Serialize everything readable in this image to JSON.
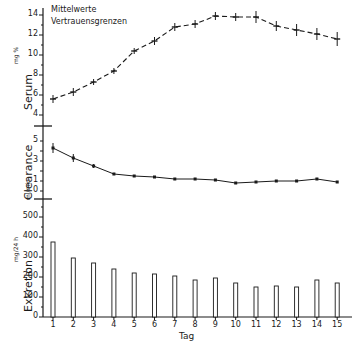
{
  "chart_data": [
    {
      "type": "line",
      "panel": "serum",
      "ylabel": "Serum",
      "yunit": "mg %",
      "yticks": [
        4,
        6,
        8,
        10,
        12,
        14
      ],
      "ylim": [
        3.5,
        14.5
      ],
      "x": [
        1,
        2,
        3,
        4,
        5,
        6,
        7,
        8,
        9,
        10,
        11,
        12,
        13,
        14,
        15
      ],
      "values": [
        5.6,
        6.3,
        7.3,
        8.4,
        10.4,
        11.4,
        12.8,
        13.1,
        13.9,
        13.8,
        13.8,
        12.9,
        12.5,
        12.1,
        11.6
      ],
      "error": [
        0.4,
        0.4,
        0.3,
        0.3,
        0.3,
        0.4,
        0.4,
        0.4,
        0.4,
        0.4,
        0.6,
        0.5,
        0.6,
        0.6,
        0.7
      ],
      "line_style": "dashed"
    },
    {
      "type": "line",
      "panel": "clearance",
      "ylabel": "Clearance",
      "yunit": "ml/min",
      "yticks": [
        0,
        1,
        3,
        5
      ],
      "ylim": [
        -0.5,
        5.5
      ],
      "x": [
        1,
        2,
        3,
        4,
        5,
        6,
        7,
        8,
        9,
        10,
        11,
        12,
        13,
        14,
        15
      ],
      "values": [
        4.3,
        3.3,
        2.5,
        1.7,
        1.5,
        1.4,
        1.2,
        1.2,
        1.1,
        0.8,
        0.9,
        1.0,
        1.0,
        1.2,
        0.9
      ],
      "error": [
        0.5,
        0.4,
        0.2,
        0.1,
        0.1,
        0.1,
        0.1,
        0.1,
        0.1,
        0.1,
        0.1,
        0.1,
        0.1,
        0.1,
        0.1
      ],
      "line_style": "solid"
    },
    {
      "type": "bar",
      "panel": "exkretion",
      "ylabel": "Exkretion",
      "yunit": "mg/24 h",
      "yticks": [
        0,
        100,
        200,
        300,
        400,
        500
      ],
      "ylim": [
        0,
        550
      ],
      "categories": [
        "1",
        "2",
        "3",
        "4",
        "5",
        "6",
        "7",
        "8",
        "9",
        "10",
        "11",
        "12",
        "13",
        "14",
        "15"
      ],
      "values": [
        375,
        295,
        270,
        240,
        220,
        215,
        205,
        185,
        195,
        170,
        150,
        155,
        150,
        185,
        170
      ],
      "xlabel": "Tag"
    }
  ],
  "legend": {
    "line1": "Mittelwerte",
    "line2": "Vertrauensgrenzen"
  },
  "labels": {
    "serum": "Serum",
    "serum_unit": "mg %",
    "clearance": "Clearance",
    "clearance_unit": "ml/min",
    "exkretion": "Exkretion",
    "exkretion_unit": "mg/24 h",
    "xlabel": "Tag"
  },
  "colors": {
    "ink": "#1a1a1a",
    "background": "#ffffff"
  }
}
